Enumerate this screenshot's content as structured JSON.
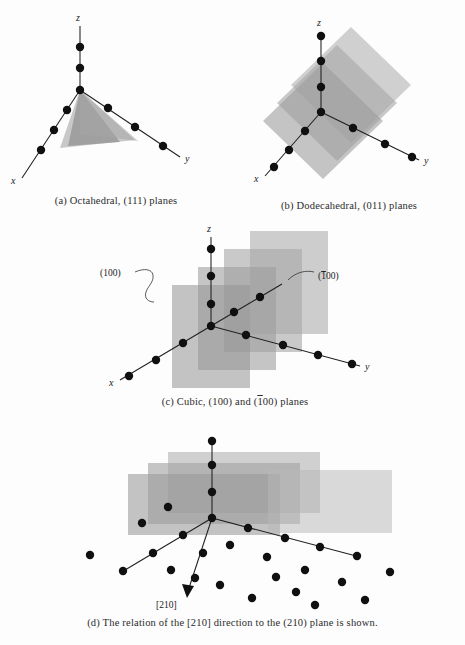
{
  "figure": {
    "type": "crystallographic-planes-diagram",
    "background_color": "#fdfdfd",
    "atom_color": "#101010",
    "axis_color": "#1f1f1f",
    "plane_fill_color": "#9a9a9a",
    "panels": [
      {
        "id": "a",
        "caption": "(a)  Octahedral, (111) planes",
        "plane_family": "(111)",
        "structure_name": "Octahedral",
        "axes": [
          "x",
          "y",
          "z"
        ],
        "plane_count": 2
      },
      {
        "id": "b",
        "caption": "(b)  Dodecahedral, (011) planes",
        "plane_family": "(011)",
        "structure_name": "Dodecahedral",
        "axes": [
          "x",
          "y",
          "z"
        ],
        "plane_count": 3
      },
      {
        "id": "c",
        "caption": "(c)  Cubic, (100) and (Ā1̅ 00) planes",
        "caption_parts": [
          "(c)  Cubic, (100) and (",
          "1",
          "00) planes"
        ],
        "plane_family": "(100)",
        "structure_name": "Cubic",
        "axes": [
          "x",
          "y",
          "z"
        ],
        "plane_count": 4,
        "annotations": [
          {
            "name": "label-100",
            "text": "(100)"
          },
          {
            "name": "label-1bar00",
            "text_prefix": "(",
            "text_bar": "1",
            "text_suffix": "00)"
          }
        ]
      },
      {
        "id": "d",
        "caption": "(d)  The relation of the [210] direction to the (210) plane is shown.",
        "plane_family": "(210)",
        "direction": "[210]",
        "axes": [
          "x",
          "y",
          "z"
        ],
        "plane_count": 3,
        "annotations": [
          {
            "name": "direction-label",
            "text": "[210]"
          }
        ]
      }
    ],
    "axis_labels": {
      "x": "x",
      "y": "y",
      "z": "z"
    }
  }
}
